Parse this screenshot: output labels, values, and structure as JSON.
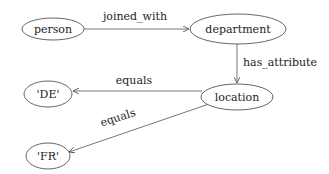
{
  "diagram": {
    "type": "directed-graph",
    "colors": {
      "stroke": "#555555",
      "text": "#222222",
      "background": "#ffffff"
    },
    "nodes": [
      {
        "id": "person",
        "label": "person"
      },
      {
        "id": "department",
        "label": "department"
      },
      {
        "id": "location",
        "label": "location"
      },
      {
        "id": "de",
        "label": "'DE'"
      },
      {
        "id": "fr",
        "label": "'FR'"
      }
    ],
    "edges": [
      {
        "from": "person",
        "to": "department",
        "label": "joined_with"
      },
      {
        "from": "department",
        "to": "location",
        "label": "has_attribute"
      },
      {
        "from": "location",
        "to": "de",
        "label": "equals"
      },
      {
        "from": "location",
        "to": "fr",
        "label": "equals"
      }
    ]
  }
}
